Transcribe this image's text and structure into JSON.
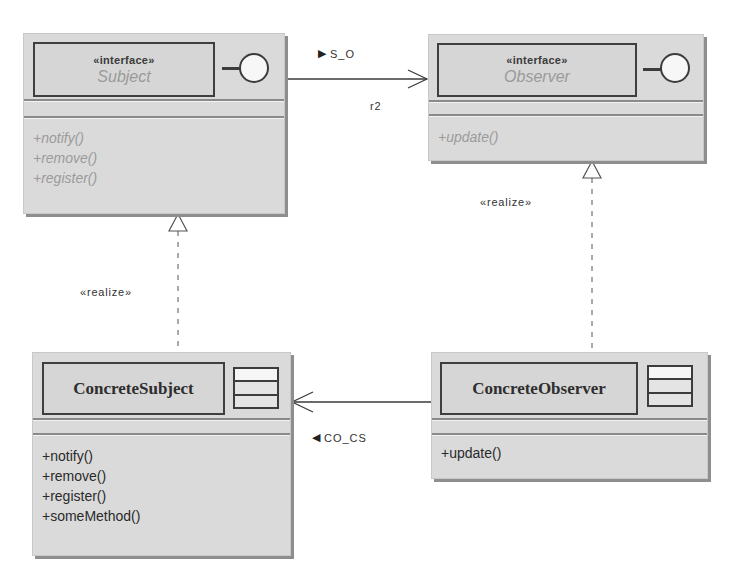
{
  "diagram": {
    "type": "UML class diagram",
    "pattern": "Observer",
    "colors": {
      "class_fill": "#dadada",
      "border": "#3f3f3f",
      "shadow": "#8e8e8e",
      "abstract_text": "#9a9a9a",
      "concrete_text": "#2a2a2a"
    }
  },
  "classes": {
    "subject": {
      "stereotype": "«interface»",
      "name": "Subject",
      "kind": "interface",
      "icon": "lollipop-interface-icon",
      "operations": [
        "+notify()",
        "+remove()",
        "+register()"
      ]
    },
    "observer": {
      "stereotype": "«interface»",
      "name": "Observer",
      "kind": "interface",
      "icon": "lollipop-interface-icon",
      "operations": [
        "+update()"
      ]
    },
    "concrete_subject": {
      "name": "ConcreteSubject",
      "kind": "class",
      "icon": "class-icon",
      "operations": [
        "+notify()",
        "+remove()",
        "+register()",
        "+someMethod()"
      ]
    },
    "concrete_observer": {
      "name": "ConcreteObserver",
      "kind": "class",
      "icon": "class-icon",
      "operations": [
        "+update()"
      ]
    }
  },
  "relationships": {
    "s_o": {
      "type": "association",
      "from": "Subject",
      "to": "Observer",
      "label": "S_O",
      "direction_glyph": "▶",
      "role": "r2"
    },
    "co_cs": {
      "type": "association",
      "from": "ConcreteObserver",
      "to": "ConcreteSubject",
      "label": "CO_CS",
      "direction_glyph": "◀"
    },
    "realize_subject": {
      "type": "realization",
      "from": "ConcreteSubject",
      "to": "Subject",
      "label": "«realize»"
    },
    "realize_observer": {
      "type": "realization",
      "from": "ConcreteObserver",
      "to": "Observer",
      "label": "«realize»"
    }
  }
}
